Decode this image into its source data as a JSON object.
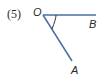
{
  "figure": {
    "number_label": "(5)",
    "points": {
      "vertex": "O",
      "ray1_end": "B",
      "ray2_end": "A"
    },
    "angle_name": "∠AOB",
    "colors": {
      "ray": "#4a6fa5",
      "arc": "#333333",
      "text": "#2a2a2a"
    }
  }
}
